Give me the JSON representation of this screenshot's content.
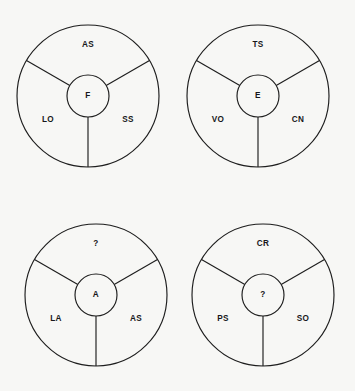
{
  "figure": {
    "type": "concept-wheel-grid",
    "background_color": "#f7f7f5",
    "stroke_color": "#1d1d1d",
    "text_color": "#17171a",
    "columns": 2,
    "rows": 2,
    "wheel_count": 4
  },
  "geometry": {
    "outer_radius": 71,
    "inner_radius": 21,
    "spoke_angles_deg": [
      90,
      210,
      330
    ],
    "sector_label_radius": 47,
    "sector_label_angles_deg": [
      270,
      30,
      150
    ]
  },
  "wheels": [
    {
      "id": "wheel-top-left",
      "center": {
        "x": 88,
        "y": 96
      },
      "center_label": "F",
      "sectors": [
        {
          "position": "top",
          "label": "AS",
          "x": 88,
          "y": 45
        },
        {
          "position": "bottom-right",
          "label": "SS",
          "x": 128,
          "y": 120
        },
        {
          "position": "bottom-left",
          "label": "LO",
          "x": 48,
          "y": 120
        }
      ]
    },
    {
      "id": "wheel-top-right",
      "center": {
        "x": 258,
        "y": 96
      },
      "center_label": "E",
      "sectors": [
        {
          "position": "top",
          "label": "TS",
          "x": 258,
          "y": 45
        },
        {
          "position": "bottom-right",
          "label": "CN",
          "x": 298,
          "y": 120
        },
        {
          "position": "bottom-left",
          "label": "VO",
          "x": 218,
          "y": 120
        }
      ]
    },
    {
      "id": "wheel-bottom-left",
      "center": {
        "x": 96,
        "y": 295
      },
      "center_label": "A",
      "sectors": [
        {
          "position": "top",
          "label": "?",
          "x": 96,
          "y": 244
        },
        {
          "position": "bottom-right",
          "label": "AS",
          "x": 136,
          "y": 319
        },
        {
          "position": "bottom-left",
          "label": "LA",
          "x": 56,
          "y": 319
        }
      ]
    },
    {
      "id": "wheel-bottom-right",
      "center": {
        "x": 263,
        "y": 295
      },
      "center_label": "?",
      "sectors": [
        {
          "position": "top",
          "label": "CR",
          "x": 263,
          "y": 244
        },
        {
          "position": "bottom-right",
          "label": "SO",
          "x": 303,
          "y": 319
        },
        {
          "position": "bottom-left",
          "label": "PS",
          "x": 223,
          "y": 319
        }
      ]
    }
  ]
}
